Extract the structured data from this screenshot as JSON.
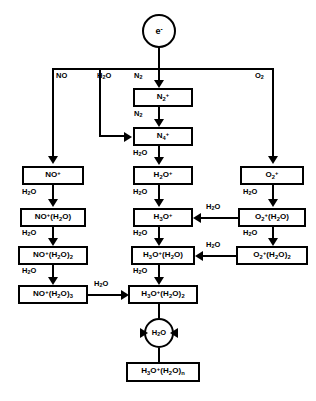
{
  "diagram": {
    "source_node": {
      "label": "e-",
      "name": "electron-source"
    },
    "bus_labels": [
      {
        "id": "no",
        "label": "NO"
      },
      {
        "id": "h2o",
        "label": "H2O"
      },
      {
        "id": "n2",
        "label": "N2"
      },
      {
        "id": "o2",
        "label": "O2"
      }
    ],
    "nodes": {
      "n2_plus": "N2+",
      "n4_plus": "N4+",
      "h2o_plus": "H2O+",
      "h3o_plus": "H3O+",
      "h3o_h2o": "H3O+(H2O)",
      "h3o_h2o_2": "H3O+(H2O)2",
      "h3o_h2o_n": "H3O+(H2O)n",
      "no_plus": "NO+",
      "no_h2o": "NO+(H2O)",
      "no_h2o_2": "NO+(H2O)2",
      "no_h2o_3": "NO+(H2O)3",
      "o2_plus": "O2+",
      "o2_h2o": "O2+(H2O)",
      "o2_h2o_2": "O2+(H2O)2",
      "h2o_hydration": "H2O"
    },
    "edge_labels": {
      "n2_to_n4": "N2",
      "n4_to_h2o": "H2O",
      "h2o_to_h3o": "H2O",
      "h3o_to_h3o1": "H2O",
      "h3o1_to_h3o2": "H2O",
      "no_to_no1": "H2O",
      "no1_to_no2": "H2O",
      "no2_to_no3": "H2O",
      "no3_to_h3o2": "H2O",
      "o2_to_o2w1": "H2O",
      "o2w1_to_o2w2": "H2O",
      "o2w1_to_h3o": "H2O",
      "o2w2_to_h3o1": "H2O"
    },
    "colors": {
      "stroke": "#000000",
      "background": "#ffffff"
    }
  }
}
